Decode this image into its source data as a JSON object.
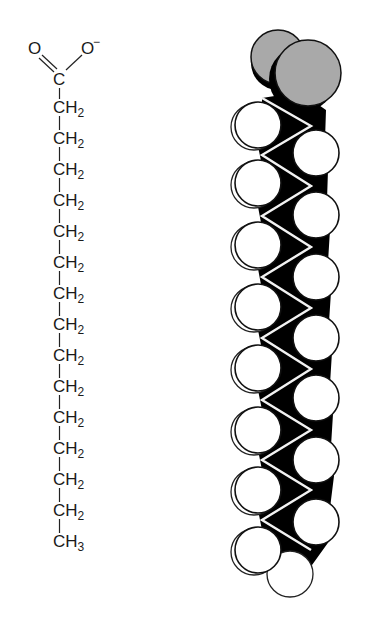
{
  "figure": {
    "structural_formula": {
      "carboxylate": {
        "oxygen_double": "O",
        "oxygen_anion": "O",
        "charge": "−",
        "carbon": "C"
      },
      "chain": [
        {
          "atom": "CH",
          "sub": "2"
        },
        {
          "atom": "CH",
          "sub": "2"
        },
        {
          "atom": "CH",
          "sub": "2"
        },
        {
          "atom": "CH",
          "sub": "2"
        },
        {
          "atom": "CH",
          "sub": "2"
        },
        {
          "atom": "CH",
          "sub": "2"
        },
        {
          "atom": "CH",
          "sub": "2"
        },
        {
          "atom": "CH",
          "sub": "2"
        },
        {
          "atom": "CH",
          "sub": "2"
        },
        {
          "atom": "CH",
          "sub": "2"
        },
        {
          "atom": "CH",
          "sub": "2"
        },
        {
          "atom": "CH",
          "sub": "2"
        },
        {
          "atom": "CH",
          "sub": "2"
        },
        {
          "atom": "CH",
          "sub": "2"
        }
      ],
      "terminal": {
        "atom": "CH",
        "sub": "3"
      }
    },
    "space_filling_model": {
      "colors": {
        "oxygen": "#a9a9a9",
        "hydrogen": "#ffffff",
        "carbon_backbone": "#000000",
        "bond_zigzag": "#f2f2f2"
      },
      "oxygen_atoms": [
        {
          "cx": 278,
          "cy": 57,
          "r": 27
        },
        {
          "cx": 308,
          "cy": 73,
          "r": 33
        }
      ],
      "left_hydrogens_y": [
        125,
        183,
        245,
        307,
        368,
        430,
        490,
        550
      ],
      "right_hydrogens_y": [
        153,
        215,
        277,
        338,
        398,
        460,
        522
      ],
      "terminal_hydrogen": {
        "cx": 290,
        "cy": 574,
        "r": 23
      }
    }
  }
}
